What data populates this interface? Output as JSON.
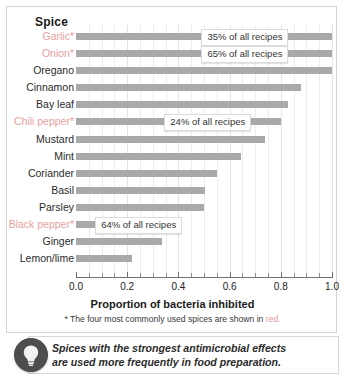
{
  "chart_data": {
    "type": "bar",
    "orientation": "horizontal",
    "title": "",
    "ylabel": "Spice",
    "xlabel": "Proportion of bacteria inhibited",
    "xlim": [
      0.0,
      1.0
    ],
    "xticks": [
      0.0,
      0.2,
      0.4,
      0.6,
      0.8,
      1.0
    ],
    "xtick_labels": [
      "0.0",
      "0.2",
      "0.4",
      "0.6",
      "0.8",
      "1.0"
    ],
    "grid": true,
    "legend": "none",
    "bar_color": "#a9a9a9",
    "highlight_color": "#e8a0a0",
    "categories": [
      "Garlic*",
      "Onion*",
      "Oregano",
      "Cinnamon",
      "Bay leaf",
      "Chili pepper*",
      "Mustard",
      "Mint",
      "Coriander",
      "Basil",
      "Parsley",
      "Black pepper*",
      "Ginger",
      "Lemon/lime"
    ],
    "values": [
      1.0,
      1.0,
      1.0,
      0.88,
      0.83,
      0.8,
      0.74,
      0.645,
      0.55,
      0.505,
      0.5,
      0.365,
      0.335,
      0.22
    ],
    "highlighted": [
      true,
      true,
      false,
      false,
      false,
      true,
      false,
      false,
      false,
      false,
      false,
      true,
      false,
      false
    ],
    "annotations": [
      {
        "category": "Garlic*",
        "text": "35% of all recipes"
      },
      {
        "category": "Onion*",
        "text": "65% of all recipes"
      },
      {
        "category": "Chili pepper*",
        "text": "24% of all recipes"
      },
      {
        "category": "Black pepper*",
        "text": "64% of all recipes"
      }
    ]
  },
  "footnote": {
    "prefix": "* The four most commonly used spices are shown in ",
    "red_word": "red."
  },
  "caption": {
    "line1": "Spices with the strongest antimicrobial effects",
    "line2": "are used more frequently in food preparation.",
    "icon": "lightbulb-icon"
  }
}
